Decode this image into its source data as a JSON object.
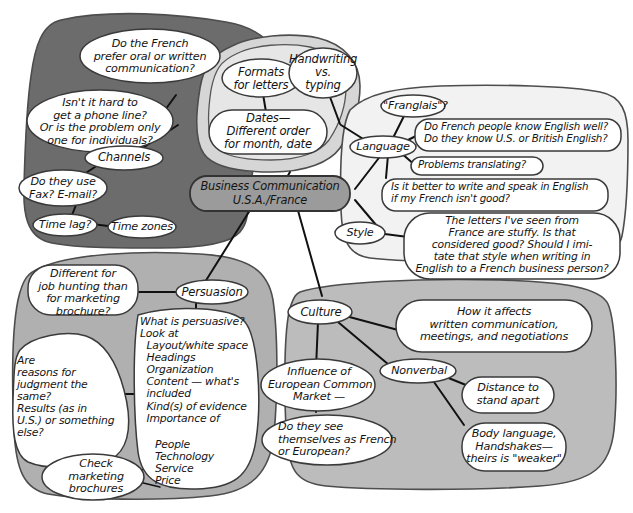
{
  "diagram": {
    "type": "mind-map",
    "center": {
      "line1": "Business Communication",
      "line2": "U.S.A./France"
    },
    "colors": {
      "channels_region": "#6c6c6c",
      "format_region": "#d6d6d6",
      "language_region": "#f2f2f2",
      "persuasion_region": "#b0b0b0",
      "culture_region": "#bcbcbc",
      "center_node": "#9b9b9b",
      "bubble_fill": "#ffffff",
      "ink": "#141414"
    },
    "branches": [
      {
        "id": "channels",
        "label": "Channels",
        "nodes": [
          {
            "id": "oral-written",
            "text": "Do the French\nprefer oral or written\ncommunication?"
          },
          {
            "id": "phone-line",
            "text": "Isn't it hard to\nget a phone line?\nOr is the problem only\none for individuals?"
          },
          {
            "id": "fax-email",
            "text": "Do they use\nFax? E-mail?"
          },
          {
            "id": "time-lag",
            "text": "Time lag?"
          },
          {
            "id": "time-zones",
            "text": "Time zones"
          }
        ]
      },
      {
        "id": "format",
        "label": "",
        "nodes": [
          {
            "id": "formats-letters",
            "text": "Formats\nfor letters"
          },
          {
            "id": "handwriting-typing",
            "text": "Handwriting\nvs.\ntyping"
          },
          {
            "id": "dates",
            "text": "Dates—\nDifferent order\nfor month, date"
          }
        ]
      },
      {
        "id": "language",
        "label": "Language",
        "nodes": [
          {
            "id": "franglais",
            "text": "\"Franglais\"?"
          },
          {
            "id": "know-english",
            "text": "Do French people know English well?\nDo they know U.S. or British English?"
          },
          {
            "id": "translating",
            "text": "Problems translating?"
          },
          {
            "id": "write-english",
            "text": "Is it better to write and speak in English\nif my French isn't good?"
          }
        ]
      },
      {
        "id": "style",
        "label": "Style",
        "nodes": [
          {
            "id": "stuffy-letters",
            "text": "The letters I've seen from\nFrance are stuffy. Is that\nconsidered good? Should I imi-\ntate that style when writing in\nEnglish to a French business person?"
          }
        ]
      },
      {
        "id": "persuasion",
        "label": "Persuasion",
        "nodes": [
          {
            "id": "job-hunting",
            "text": "Different for\njob hunting than\nfor marketing\nbrochure?"
          },
          {
            "id": "reasons-judgment",
            "text": "Are\nreasons for\njudgment the\nsame?\nResults (as in\nU.S.) or something\nelse?"
          },
          {
            "id": "what-persuasive",
            "text": "What is persuasive?\nLook at\n  Layout/white space\n  Headings\n  Organization\n  Content — what's\n  included\n  Kind(s) of evidence\n  Importance of"
          },
          {
            "id": "importance-list",
            "text": "People\nTechnology\nService\nPrice"
          },
          {
            "id": "check-brochures",
            "text": "Check\nmarketing\nbrochures"
          }
        ]
      },
      {
        "id": "culture",
        "label": "Culture",
        "nodes": [
          {
            "id": "how-affects",
            "text": "How it affects\nwritten communication,\nmeetings, and negotiations"
          },
          {
            "id": "common-market",
            "text": "Influence of\nEuropean Common\nMarket —"
          },
          {
            "id": "french-or-european",
            "text": "Do they see\nthemselves as French\nor European?"
          },
          {
            "id": "nonverbal",
            "text": "Nonverbal"
          },
          {
            "id": "distance",
            "text": "Distance to\nstand apart"
          },
          {
            "id": "body-language",
            "text": "Body language,\nHandshakes—\ntheirs is \"weaker\""
          }
        ]
      }
    ]
  }
}
